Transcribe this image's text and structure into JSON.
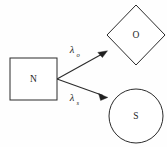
{
  "diagram": {
    "background_color": "#fefefe",
    "stroke_color": "#2b2b2b",
    "label_color": "#1f1f1f",
    "nodes": [
      {
        "id": "n",
        "label": "N",
        "shape": "square",
        "cx": 33.5,
        "cy": 79,
        "width": 47,
        "height": 42
      },
      {
        "id": "o",
        "label": "O",
        "shape": "diamond",
        "cx": 136,
        "cy": 35,
        "rx": 29,
        "ry": 30
      },
      {
        "id": "s",
        "label": "S",
        "shape": "circle",
        "cx": 136,
        "cy": 116,
        "r": 27
      }
    ],
    "edges": [
      {
        "id": "edge-n-to-o",
        "from": "n",
        "to": "o",
        "label_main": "λ",
        "label_sub": "o",
        "label_full": "λₒ",
        "label_x": 73,
        "label_y": 54,
        "x1": 57,
        "y1": 79,
        "x2": 107,
        "y2": 51
      },
      {
        "id": "edge-n-to-s",
        "from": "n",
        "to": "s",
        "label_main": "λ",
        "label_sub": "s",
        "label_full": "λₛ",
        "label_x": 73,
        "label_y": 102,
        "x1": 57,
        "y1": 79,
        "x2": 107,
        "y2": 99
      }
    ]
  }
}
